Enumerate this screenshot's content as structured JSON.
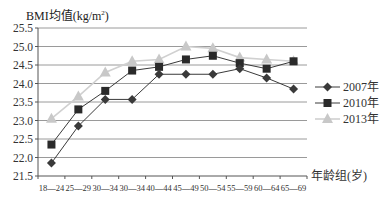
{
  "chart_data": {
    "type": "line",
    "title": "",
    "ylabel": "BMI均值(kg/m²)",
    "ylabel_base": "BMI均值(kg/m",
    "ylabel_sup": "2",
    "ylabel_tail": ")",
    "xlabel": "年龄组(岁)",
    "ylim": [
      21.5,
      25.5
    ],
    "yticks": [
      "21.5",
      "22.0",
      "22.5",
      "23.0",
      "23.5",
      "24.0",
      "24.5",
      "25.0",
      "25.5"
    ],
    "categories": [
      "18—24",
      "25—29",
      "30—34",
      "30—34",
      "40—44",
      "45—49",
      "50—54",
      "55—59",
      "60—64",
      "65—69"
    ],
    "grid": true,
    "legend_position": "right",
    "series": [
      {
        "name": "2007年",
        "marker": "diamond",
        "color": "#3a3a3a",
        "values": [
          21.85,
          22.85,
          23.57,
          23.57,
          24.25,
          24.25,
          24.25,
          24.4,
          24.15,
          23.85
        ]
      },
      {
        "name": "2010年",
        "marker": "square",
        "color": "#2a2a2a",
        "values": [
          22.35,
          23.3,
          23.8,
          24.35,
          24.45,
          24.65,
          24.75,
          24.55,
          24.4,
          24.6
        ]
      },
      {
        "name": "2013年",
        "marker": "triangle",
        "color": "#c8c8c8",
        "values": [
          23.05,
          23.65,
          24.3,
          24.6,
          24.65,
          25.0,
          24.95,
          24.7,
          24.65,
          24.6
        ]
      }
    ]
  }
}
